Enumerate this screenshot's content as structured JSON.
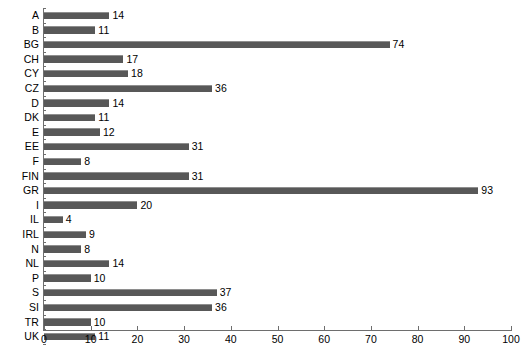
{
  "chart_data": {
    "type": "bar",
    "orientation": "horizontal",
    "title": "",
    "subtitle": "",
    "xlabel": "",
    "ylabel": "",
    "xlim": [
      0,
      100
    ],
    "ylim": null,
    "grid": false,
    "legend": null,
    "legend_position": "none",
    "xticks": [
      0,
      10,
      20,
      30,
      40,
      50,
      60,
      70,
      80,
      90,
      100
    ],
    "xtick_labels": [
      "0",
      "10",
      "20",
      "30",
      "40",
      "50",
      "60",
      "70",
      "80",
      "90",
      "100"
    ],
    "categories": [
      "A",
      "B",
      "BG",
      "CH",
      "CY",
      "CZ",
      "D",
      "DK",
      "E",
      "EE",
      "F",
      "FIN",
      "GR",
      "I",
      "IL",
      "IRL",
      "N",
      "NL",
      "P",
      "S",
      "SI",
      "TR",
      "UK"
    ],
    "values": [
      14,
      11,
      74,
      17,
      18,
      36,
      14,
      11,
      12,
      31,
      8,
      31,
      93,
      20,
      4,
      9,
      8,
      14,
      10,
      37,
      36,
      10,
      11
    ],
    "data_labels": [
      "14",
      "11",
      "74",
      "17",
      "18",
      "36",
      "14",
      "11",
      "12",
      "31",
      "8",
      "31",
      "93",
      "20",
      "4",
      "9",
      "8",
      "14",
      "10",
      "37",
      "36",
      "10",
      "11"
    ],
    "bar_color": "#585858",
    "axis_color": "#6e6e6e",
    "background_color": "#ffffff"
  }
}
